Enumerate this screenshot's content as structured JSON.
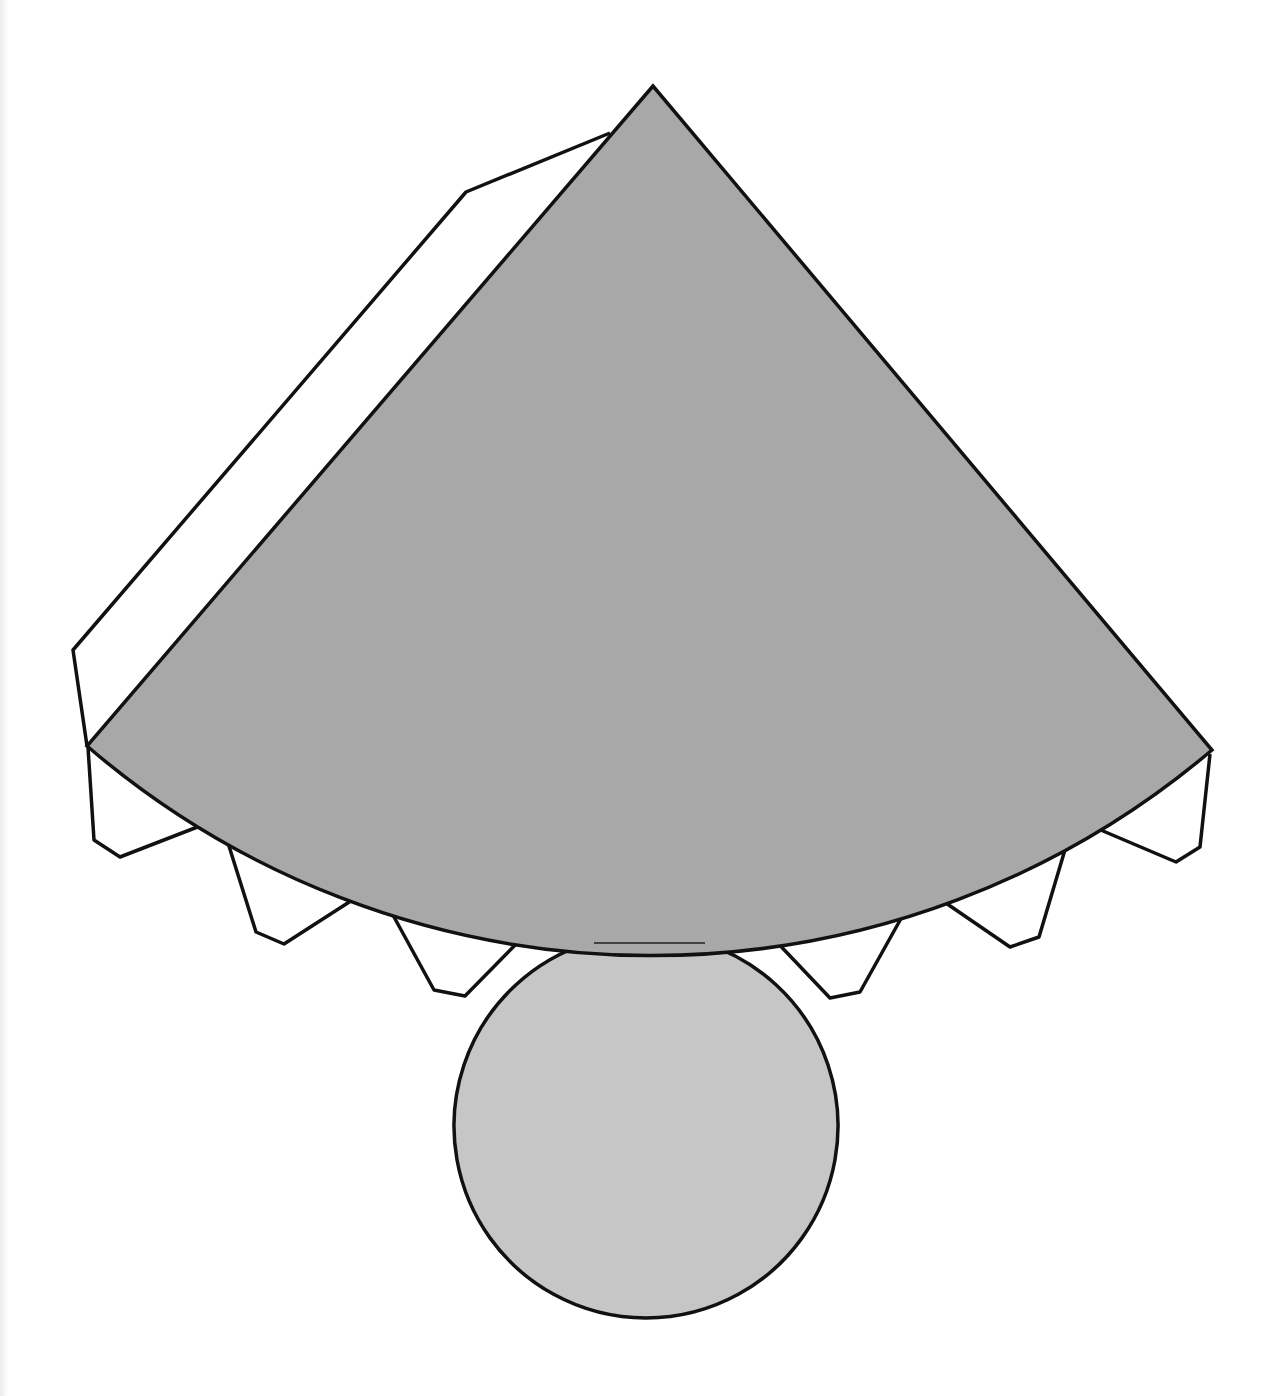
{
  "diagram": {
    "colors": {
      "sector_fill": "#a8a8a8",
      "base_fill": "#c6c6c6",
      "outline": "#111111",
      "tab_fill": "#ffffff",
      "background": "#ffffff"
    },
    "sector": {
      "apex": [
        653,
        86
      ],
      "left_corner": [
        87,
        746
      ],
      "right_corner": [
        1212,
        750
      ],
      "arc_radius": 866
    },
    "side_tab": {
      "points": [
        [
          610,
          133
        ],
        [
          466,
          192
        ],
        [
          73,
          650
        ],
        [
          87,
          746
        ]
      ]
    },
    "bottom_tabs": [
      {
        "points": [
          [
            88,
            747
          ],
          [
            94,
            840
          ],
          [
            120,
            857
          ],
          [
            200,
            826
          ]
        ]
      },
      {
        "points": [
          [
            228,
            843
          ],
          [
            256,
            932
          ],
          [
            284,
            944
          ],
          [
            357,
            897
          ]
        ]
      },
      {
        "points": [
          [
            388,
            906
          ],
          [
            434,
            990
          ],
          [
            465,
            996
          ],
          [
            525,
            935
          ]
        ]
      },
      {
        "points": [
          [
            772,
            937
          ],
          [
            830,
            998
          ],
          [
            860,
            992
          ],
          [
            908,
            906
          ]
        ]
      },
      {
        "points": [
          [
            940,
            899
          ],
          [
            1010,
            947
          ],
          [
            1039,
            937
          ],
          [
            1067,
            843
          ]
        ]
      },
      {
        "points": [
          [
            1096,
            828
          ],
          [
            1176,
            862
          ],
          [
            1200,
            847
          ],
          [
            1210,
            754
          ]
        ]
      }
    ],
    "connector": {
      "x1": 594,
      "x2": 705,
      "y": 943
    },
    "base_circle": {
      "cx": 646,
      "cy": 1126,
      "r": 192
    }
  }
}
